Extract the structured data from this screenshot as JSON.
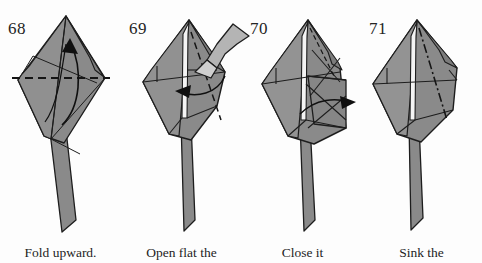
{
  "page": {
    "background_color": "#fdfdfd",
    "ink_color": "#1d1d1d",
    "paper_fill": "#8a8a8a",
    "paper_fill_light": "#9a9a9a",
    "paper_fill_dark": "#707070",
    "kind": "origami-instruction-diagram"
  },
  "steps": [
    {
      "number": "68",
      "caption": "Fold upward.",
      "fold_type": "valley-fold",
      "line_style": "dashed-horizontal",
      "arrow": "curved-arrow-up"
    },
    {
      "number": "69",
      "caption": "Open flat the",
      "fold_type": "open-flat",
      "line_style": "dashed-diagonal",
      "arrow": "hollow-open-arrow-and-curved-arrow-left"
    },
    {
      "number": "70",
      "caption": "Close it",
      "fold_type": "close",
      "line_style": "crease-lines",
      "arrow": "curved-arrow-right"
    },
    {
      "number": "71",
      "caption": "Sink the",
      "fold_type": "sink-fold",
      "line_style": "dash-dot-diagonal",
      "arrow": "none"
    }
  ]
}
